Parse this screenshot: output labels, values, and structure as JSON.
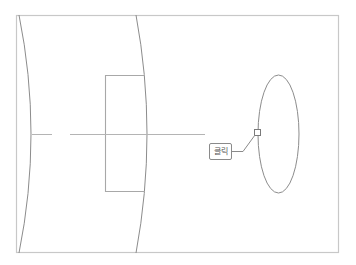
{
  "diagram": {
    "colors": {
      "frame": "#c8c8c8",
      "stroke": "#8c8c8c",
      "axis": "#b4b4b4",
      "label_border": "#8a8a8a",
      "label_text": "#555555"
    },
    "frame": {
      "x": 16,
      "y": 15,
      "width": 323,
      "height": 238
    },
    "shapes": [
      {
        "type": "curve",
        "name": "left-lens-surface"
      },
      {
        "type": "curve",
        "name": "right-lens-surface"
      },
      {
        "type": "rectangle",
        "name": "inner-rectangle"
      },
      {
        "type": "ellipse",
        "name": "ellipse",
        "cx": 278,
        "cy": 134,
        "rx": 20.5,
        "ry": 59
      },
      {
        "type": "line",
        "name": "horizontal-axis",
        "y": 134
      }
    ],
    "callout": {
      "label": "클릭",
      "anchor_marker": "square"
    }
  }
}
